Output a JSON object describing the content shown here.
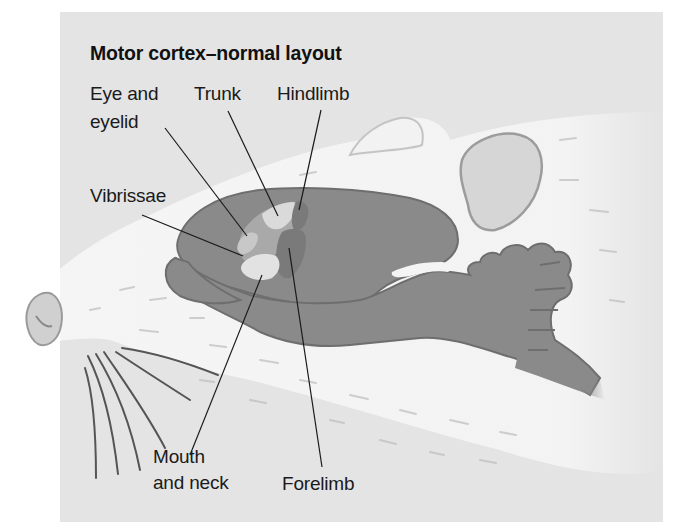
{
  "figure": {
    "title": "Motor cortex–normal layout",
    "labels": {
      "eye_and_eyelid": [
        "Eye and",
        "eyelid"
      ],
      "trunk": "Trunk",
      "hindlimb": "Hindlimb",
      "vibrissae": "Vibrissae",
      "mouth_and_neck": [
        "Mouth",
        "and neck"
      ],
      "forelimb": "Forelimb"
    },
    "colors": {
      "panel_background": "#e4e4e4",
      "brain": "#8a8a8a",
      "brain_outline": "#6e6e6e",
      "fur": "#f4f4f4",
      "region_light": "#d9d9d9",
      "region_mid": "#a9a9a9",
      "region_dark": "#7a7a7a",
      "leader_line": "#1a1a1a"
    }
  }
}
